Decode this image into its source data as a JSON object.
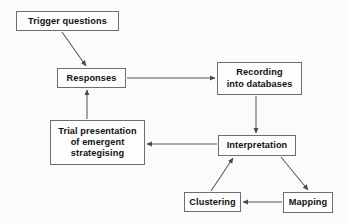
{
  "diagram": {
    "background_color": "#fbfbfb",
    "box_border_color": "#6e6e6e",
    "box_fill_color": "#fdfdfd",
    "text_color": "#111111",
    "edge_color": "#585858",
    "nodes": [
      {
        "id": "trigger-questions",
        "label": "Trigger  questions",
        "x": 16,
        "y": 11,
        "w": 103,
        "h": 20
      },
      {
        "id": "responses",
        "label": "Responses",
        "x": 57,
        "y": 68,
        "w": 69,
        "h": 20
      },
      {
        "id": "recording-into-databases",
        "label": "Recording\ninto databases",
        "x": 217,
        "y": 62,
        "w": 85,
        "h": 33
      },
      {
        "id": "trial-presentation",
        "label": "Trial presentation\nof emergent\nstrategising",
        "x": 50,
        "y": 120,
        "w": 95,
        "h": 45
      },
      {
        "id": "interpretation",
        "label": "Interpretation",
        "x": 218,
        "y": 135,
        "w": 78,
        "h": 21
      },
      {
        "id": "clustering",
        "label": "Clustering",
        "x": 184,
        "y": 192,
        "w": 57,
        "h": 20
      },
      {
        "id": "mapping",
        "label": "Mapping",
        "x": 283,
        "y": 192,
        "w": 50,
        "h": 21
      }
    ],
    "edges": [
      {
        "id": "trigger-to-responses",
        "from": "trigger-questions",
        "to": "responses",
        "kind": "diagonal",
        "x1": 62,
        "y1": 32,
        "x2": 86,
        "y2": 66
      },
      {
        "id": "responses-to-recording",
        "from": "responses",
        "to": "recording-into-databases",
        "kind": "horizontal",
        "x1": 127,
        "y1": 78,
        "x2": 215,
        "y2": 78
      },
      {
        "id": "recording-to-interpretation",
        "from": "recording-into-databases",
        "to": "interpretation",
        "kind": "vertical",
        "x1": 256,
        "y1": 96,
        "x2": 256,
        "y2": 133
      },
      {
        "id": "interpretation-to-trial-presentation",
        "from": "interpretation",
        "to": "trial-presentation",
        "kind": "horizontal",
        "x1": 217,
        "y1": 144,
        "x2": 147,
        "y2": 144
      },
      {
        "id": "trial-presentation-to-responses",
        "from": "trial-presentation",
        "to": "responses",
        "kind": "vertical",
        "x1": 87,
        "y1": 119,
        "x2": 87,
        "y2": 90
      },
      {
        "id": "interpretation-to-mapping",
        "from": "interpretation",
        "to": "mapping",
        "kind": "diagonal",
        "x1": 281,
        "y1": 157,
        "x2": 308,
        "y2": 190
      },
      {
        "id": "mapping-to-clustering",
        "from": "mapping",
        "to": "clustering",
        "kind": "horizontal",
        "x1": 282,
        "y1": 202,
        "x2": 243,
        "y2": 202
      },
      {
        "id": "clustering-to-interpretation",
        "from": "clustering",
        "to": "interpretation",
        "kind": "diagonal",
        "x1": 211,
        "y1": 191,
        "x2": 233,
        "y2": 158
      }
    ]
  }
}
